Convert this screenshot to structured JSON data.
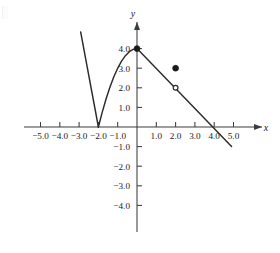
{
  "figure": {
    "background_color": "#ffffff",
    "ink_color": "#2b2b2b"
  },
  "chart_data": {
    "type": "line",
    "title": "",
    "xlabel": "x",
    "ylabel": "y",
    "xlim": [
      -5.8,
      5.8
    ],
    "ylim": [
      -4.8,
      4.9
    ],
    "grid": false,
    "legend": null,
    "x_ticks": [
      -5.0,
      -4.0,
      -3.0,
      -2.0,
      -1.0,
      1.0,
      2.0,
      3.0,
      4.0,
      5.0
    ],
    "x_tick_labels": [
      "-5.0",
      "-4.0",
      "-3.0",
      "-2.0",
      "-1.0",
      "1.0",
      "2.0",
      "3.0",
      "4.0",
      "5.0"
    ],
    "y_ticks": [
      4.0,
      3.0,
      2.0,
      1.0,
      -1.0,
      -2.0,
      -3.0,
      -4.0
    ],
    "y_tick_labels": [
      "4.0",
      "3.0",
      "2.0",
      "1.0",
      "-1.0",
      "-2.0",
      "-3.0",
      "-4.0"
    ],
    "series": [
      {
        "name": "left-branch",
        "style": "solid",
        "points": [
          [
            -2.92,
            4.85
          ],
          [
            -2.0,
            0.0
          ]
        ]
      },
      {
        "name": "rising-arc",
        "style": "solid",
        "points": [
          [
            -2.0,
            0.0
          ],
          [
            -1.8,
            0.76
          ],
          [
            -1.6,
            1.44
          ],
          [
            -1.4,
            2.04
          ],
          [
            -1.2,
            2.56
          ],
          [
            -1.0,
            3.0
          ],
          [
            -0.8,
            3.36
          ],
          [
            -0.6,
            3.64
          ],
          [
            -0.4,
            3.84
          ],
          [
            -0.2,
            3.96
          ],
          [
            0.0,
            4.0
          ]
        ]
      },
      {
        "name": "descending-line",
        "style": "solid",
        "points": [
          [
            0.0,
            4.0
          ],
          [
            4.9,
            -1.0
          ]
        ]
      }
    ],
    "markers": [
      {
        "name": "closed-point-origin-four",
        "x": 0.0,
        "y": 4.0,
        "type": "filled"
      },
      {
        "name": "closed-point-two-three",
        "x": 2.0,
        "y": 3.0,
        "type": "filled"
      },
      {
        "name": "open-point-two-two",
        "x": 2.0,
        "y": 2.0,
        "type": "open"
      }
    ],
    "annotations": []
  }
}
